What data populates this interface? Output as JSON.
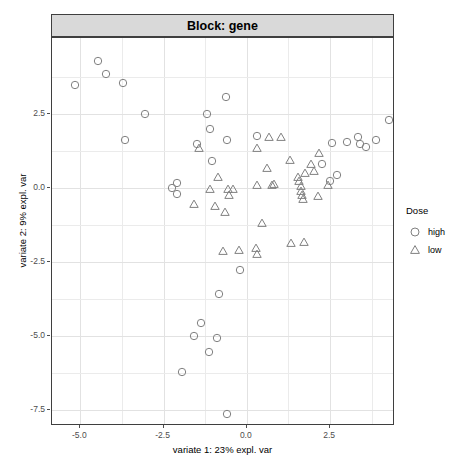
{
  "strip": {
    "label": "Block: gene"
  },
  "axes": {
    "x_title": "variate 1: 23% expl. var",
    "y_title": "variate 2: 9% expl. var",
    "x_ticks": [
      "-5.0",
      "-2.5",
      "0.0",
      "2.5"
    ],
    "x_tick_values": [
      -5.0,
      -2.5,
      0.0,
      2.5
    ],
    "y_ticks": [
      "2.5",
      "0.0",
      "-2.5",
      "-5.0",
      "-7.5"
    ],
    "y_tick_values": [
      2.5,
      0.0,
      -2.5,
      -5.0,
      -7.5
    ]
  },
  "legend": {
    "title": "Dose",
    "items": [
      {
        "label": "high",
        "shape": "circle-open-icon"
      },
      {
        "label": "low",
        "shape": "triangle-open-icon"
      }
    ]
  },
  "colors": {
    "point_stroke": "#808080",
    "panel_border": "#3f3f3f",
    "strip_fill": "#d9d9d9",
    "grid_minor": "#ebebeb",
    "grid_major": "#e2e2e2",
    "tick_text": "#4d4d4d"
  },
  "chart_data": {
    "type": "scatter",
    "title": "Block: gene",
    "xlabel": "variate 1: 23% expl. var",
    "ylabel": "variate 2: 9% expl. var",
    "xlim": [
      -5.85,
      4.45
    ],
    "ylim": [
      -8.05,
      5.05
    ],
    "grid": true,
    "legend_position": "right",
    "legend_title": "Dose",
    "series": [
      {
        "name": "high",
        "marker": "circle-open",
        "points": [
          [
            -5.16,
            3.46
          ],
          [
            -4.46,
            4.27
          ],
          [
            -4.22,
            3.82
          ],
          [
            -3.73,
            3.52
          ],
          [
            -3.07,
            2.5
          ],
          [
            -3.67,
            1.6
          ],
          [
            -1.51,
            1.46
          ],
          [
            -1.2,
            2.47
          ],
          [
            -1.11,
            1.97
          ],
          [
            -1.06,
            0.89
          ],
          [
            -0.62,
            3.05
          ],
          [
            -0.6,
            1.6
          ],
          [
            -2.09,
            0.17
          ],
          [
            -2.24,
            0.0
          ],
          [
            -2.09,
            -0.23
          ],
          [
            0.3,
            1.73
          ],
          [
            2.25,
            0.78
          ],
          [
            2.7,
            0.42
          ],
          [
            2.56,
            1.49
          ],
          [
            3.35,
            1.72
          ],
          [
            3.4,
            1.48
          ],
          [
            3.59,
            1.36
          ],
          [
            3.89,
            1.6
          ],
          [
            4.28,
            2.27
          ],
          [
            3.0,
            1.55
          ],
          [
            2.5,
            0.22
          ],
          [
            -0.19,
            -2.79
          ],
          [
            -0.83,
            -3.58
          ],
          [
            -1.39,
            -4.58
          ],
          [
            -1.6,
            -5.02
          ],
          [
            -0.91,
            -5.08
          ],
          [
            -1.14,
            -5.55
          ],
          [
            -1.96,
            -6.21
          ],
          [
            -0.59,
            -7.66
          ]
        ]
      },
      {
        "name": "low",
        "marker": "triangle-open",
        "points": [
          [
            -1.44,
            1.33
          ],
          [
            -1.11,
            -0.06
          ],
          [
            -0.97,
            -0.63
          ],
          [
            -1.6,
            -0.57
          ],
          [
            -0.86,
            0.37
          ],
          [
            -0.56,
            -0.05
          ],
          [
            -0.53,
            -0.25
          ],
          [
            -0.66,
            -0.84
          ],
          [
            -0.41,
            -0.04
          ],
          [
            0.3,
            1.35
          ],
          [
            0.67,
            1.7
          ],
          [
            1.02,
            1.7
          ],
          [
            0.6,
            0.66
          ],
          [
            0.3,
            0.07
          ],
          [
            0.75,
            0.09
          ],
          [
            0.82,
            0.11
          ],
          [
            1.55,
            0.35
          ],
          [
            1.58,
            0.21
          ],
          [
            1.62,
            0.06
          ],
          [
            1.64,
            -0.1
          ],
          [
            1.66,
            -0.25
          ],
          [
            1.68,
            -0.39
          ],
          [
            1.74,
            0.48
          ],
          [
            1.94,
            0.8
          ],
          [
            2.02,
            0.55
          ],
          [
            2.18,
            1.18
          ],
          [
            2.45,
            0.08
          ],
          [
            2.14,
            -0.28
          ],
          [
            1.3,
            0.92
          ],
          [
            -0.72,
            -2.14
          ],
          [
            -0.23,
            -2.1
          ],
          [
            0.27,
            -2.04
          ],
          [
            0.3,
            -2.24
          ],
          [
            1.33,
            -1.88
          ],
          [
            1.72,
            -1.83
          ],
          [
            0.47,
            -1.2
          ]
        ]
      }
    ]
  }
}
